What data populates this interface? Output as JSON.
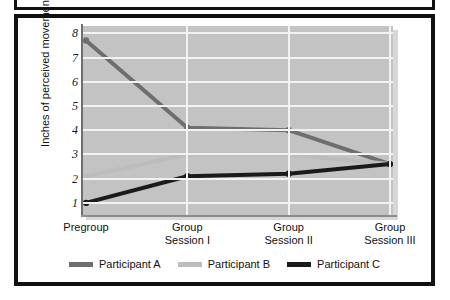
{
  "chart_data": {
    "type": "line",
    "title": "",
    "xlabel": "",
    "ylabel": "Inches of perceived movement",
    "categories": [
      "Pregroup",
      "Group Session I",
      "Group Session II",
      "Group Session III"
    ],
    "category_lines": [
      [
        "Pregroup"
      ],
      [
        "Group",
        "Session I"
      ],
      [
        "Group",
        "Session II"
      ],
      [
        "Group",
        "Session III"
      ]
    ],
    "ylim": [
      0.5,
      8.3
    ],
    "yticks": [
      8,
      7,
      6,
      5,
      4,
      3,
      2,
      1
    ],
    "grid": true,
    "legend_position": "bottom",
    "series": [
      {
        "name": "Participant A",
        "color": "#6e6e6e",
        "values": [
          7.7,
          4.1,
          4.0,
          2.6
        ],
        "markers": true
      },
      {
        "name": "Participant B",
        "color": "#bcbcbc",
        "values": [
          2.1,
          3.0,
          3.0,
          2.6
        ],
        "markers": false
      },
      {
        "name": "Participant C",
        "color": "#1a1a1a",
        "values": [
          1.0,
          2.1,
          2.2,
          2.6
        ],
        "markers": true
      }
    ]
  },
  "style": {
    "plot_background": "#c3c3c3",
    "gridline_color": "#f2f2f2",
    "frame_color": "#111111",
    "page_background": "#ffffff"
  }
}
